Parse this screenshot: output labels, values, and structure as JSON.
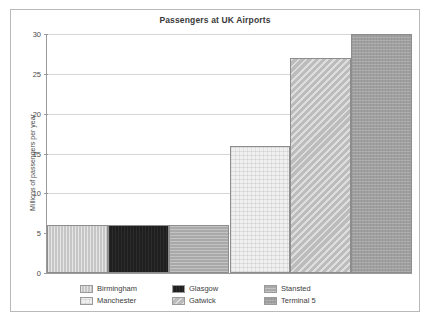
{
  "chart_data": {
    "type": "bar",
    "title": "Passengers at UK Airports",
    "xlabel": "",
    "ylabel": "Millions of passengers per year",
    "categories": [
      "Birmingham",
      "Glasgow",
      "Stansted",
      "Manchester",
      "Gatwick",
      "Terminal 5"
    ],
    "values": [
      6,
      6,
      6,
      16,
      27,
      30
    ],
    "ylim": [
      0,
      30
    ],
    "yticks": [
      0,
      5,
      10,
      15,
      20,
      25,
      30
    ],
    "ytick_labels": [
      "0",
      "5",
      "10",
      "15",
      "20",
      "25",
      "30"
    ],
    "grid": true,
    "legend_position": "bottom",
    "bar_gap": 0,
    "series_colors": [
      "#c6c6c6",
      "#1f1f1f",
      "#a9a9a9",
      "#f0f0f0",
      "#bcbcbc",
      "#9f9f9f"
    ],
    "bars": [
      {
        "label": "Birmingham",
        "value": 6,
        "fill_class": "fill-birmingham",
        "color": "#c6c6c6"
      },
      {
        "label": "Glasgow",
        "value": 6,
        "fill_class": "fill-glasgow",
        "color": "#1f1f1f"
      },
      {
        "label": "Stansted",
        "value": 6,
        "fill_class": "fill-stansted",
        "color": "#a9a9a9"
      },
      {
        "label": "Manchester",
        "value": 16,
        "fill_class": "fill-manchester",
        "color": "#f0f0f0"
      },
      {
        "label": "Gatwick",
        "value": 27,
        "fill_class": "fill-gatwick",
        "color": "#bcbcbc"
      },
      {
        "label": "Terminal 5",
        "value": 30,
        "fill_class": "fill-terminal5",
        "color": "#9f9f9f"
      }
    ]
  },
  "legend": {
    "entries": [
      {
        "label": "Birmingham",
        "fill_class": "fill-birmingham"
      },
      {
        "label": "Glasgow",
        "fill_class": "fill-glasgow"
      },
      {
        "label": "Stansted",
        "fill_class": "fill-stansted"
      },
      {
        "label": "Manchester",
        "fill_class": "fill-manchester"
      },
      {
        "label": "Gatwick",
        "fill_class": "fill-gatwick"
      },
      {
        "label": "Terminal 5",
        "fill_class": "fill-terminal5"
      }
    ]
  },
  "theme": {
    "frame_border": "#b9b9b9",
    "axis_color": "#9a9a9a",
    "grid_color": "#d6d6d6",
    "text_color": "#3d3d3d",
    "background": "#ffffff"
  }
}
